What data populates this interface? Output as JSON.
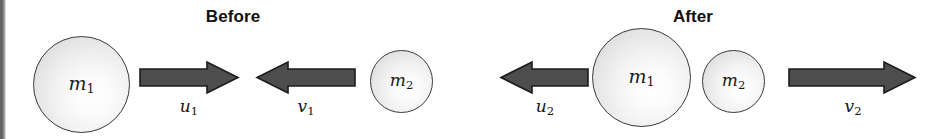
{
  "figure": {
    "type": "physics-collision-diagram",
    "width": 942,
    "height": 139,
    "background_color": "#ffffff"
  },
  "panels": [
    {
      "key": "before",
      "title": "Before"
    },
    {
      "key": "after",
      "title": "After"
    }
  ],
  "before": {
    "title": "Before",
    "bodies": [
      {
        "id": "m1",
        "label": "m",
        "subscript": "1",
        "size": "large"
      },
      {
        "id": "m2",
        "label": "m",
        "subscript": "2",
        "size": "small"
      }
    ],
    "vectors": [
      {
        "id": "u1",
        "label": "u",
        "subscript": "1",
        "direction": "right"
      },
      {
        "id": "v1",
        "label": "v",
        "subscript": "1",
        "direction": "left"
      }
    ]
  },
  "after": {
    "title": "After",
    "bodies": [
      {
        "id": "m1",
        "label": "m",
        "subscript": "1",
        "size": "large"
      },
      {
        "id": "m2",
        "label": "m",
        "subscript": "2",
        "size": "small"
      }
    ],
    "vectors": [
      {
        "id": "u2",
        "label": "u",
        "subscript": "2",
        "direction": "left"
      },
      {
        "id": "v2",
        "label": "v",
        "subscript": "2",
        "direction": "right"
      }
    ]
  },
  "colors": {
    "arrow_fill": "#4d4d4d",
    "arrow_stroke": "#1c1c1c",
    "ball_stroke": "#3a3a3a",
    "ball_highlight": "#ffffff",
    "ball_shade": "#cfcfcf",
    "text": "#111111"
  }
}
